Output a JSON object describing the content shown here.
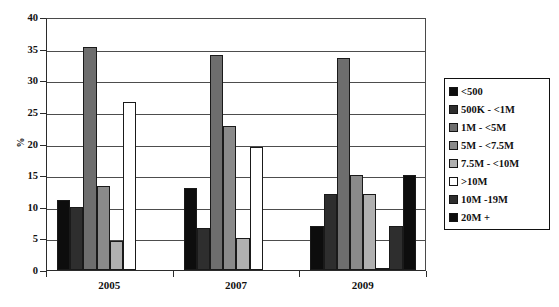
{
  "chart_data": {
    "type": "bar",
    "title": "",
    "xlabel": "",
    "ylabel": "%",
    "ylim": [
      0,
      40
    ],
    "ytick_step": 5,
    "yticks": [
      40,
      35,
      30,
      25,
      20,
      15,
      10,
      5,
      0
    ],
    "grid": true,
    "legend_position": "right",
    "categories": [
      "2005",
      "2007",
      "2009"
    ],
    "series": [
      {
        "name": "<500",
        "color": "#0d0d0d",
        "values": [
          11.0,
          13.0,
          6.9
        ]
      },
      {
        "name": "500K - <1M",
        "color": "#2e2e2e",
        "values": [
          10.0,
          6.6,
          12.0
        ]
      },
      {
        "name": "1M - <5M",
        "color": "#6e6e6e",
        "values": [
          35.2,
          34.0,
          33.5
        ]
      },
      {
        "name": "5M - <7.5M",
        "color": "#8a8a8a",
        "values": [
          13.3,
          22.7,
          15.0
        ]
      },
      {
        "name": "7.5M - <10M",
        "color": "#b0b0b0",
        "values": [
          4.6,
          5.1,
          12.0
        ]
      },
      {
        "name": ">10M",
        "color": "#ffffff",
        "values": [
          26.5,
          19.5,
          0.0
        ]
      },
      {
        "name": "10M -19M",
        "color": "#2e2e2e",
        "values": [
          0.0,
          0.0,
          6.9
        ]
      },
      {
        "name": "20M +",
        "color": "#0d0d0d",
        "values": [
          0.0,
          0.0,
          15.0
        ]
      }
    ]
  },
  "axis": {
    "y_title": "%",
    "y_labels": [
      "40",
      "35",
      "30",
      "25",
      "20",
      "15",
      "10",
      "5",
      "0"
    ],
    "x_labels": [
      "2005",
      "2007",
      "2009"
    ]
  },
  "legend": {
    "items": [
      {
        "label": "<500"
      },
      {
        "label": "500K - <1M"
      },
      {
        "label": "1M - <5M"
      },
      {
        "label": "5M - <7.5M"
      },
      {
        "label": "7.5M - <10M"
      },
      {
        "label": ">10M"
      },
      {
        "label": "10M -19M"
      },
      {
        "label": "20M +"
      }
    ]
  },
  "caption": {
    "text": ""
  }
}
